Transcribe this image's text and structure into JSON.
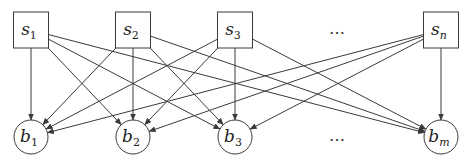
{
  "diagram": {
    "type": "bipartite-directed-graph",
    "sources": [
      {
        "id": "s1",
        "base": "s",
        "sub": "1",
        "x": 31
      },
      {
        "id": "s2",
        "base": "s",
        "sub": "2",
        "x": 133
      },
      {
        "id": "s3",
        "base": "s",
        "sub": "3",
        "x": 235
      },
      {
        "id": "sn",
        "base": "s",
        "sub": "n",
        "x": 441
      }
    ],
    "targets": [
      {
        "id": "b1",
        "base": "b",
        "sub": "1",
        "x": 31
      },
      {
        "id": "b2",
        "base": "b",
        "sub": "2",
        "x": 133
      },
      {
        "id": "b3",
        "base": "b",
        "sub": "3",
        "x": 235
      },
      {
        "id": "bm",
        "base": "b",
        "sub": "m",
        "x": 441
      }
    ],
    "ellipsis_top": "…",
    "ellipsis_bottom": "…",
    "edges": [
      [
        "s1",
        "b1"
      ],
      [
        "s1",
        "b2"
      ],
      [
        "s1",
        "b3"
      ],
      [
        "s1",
        "bm"
      ],
      [
        "s2",
        "b1"
      ],
      [
        "s2",
        "b2"
      ],
      [
        "s2",
        "b3"
      ],
      [
        "s2",
        "bm"
      ],
      [
        "s3",
        "b1"
      ],
      [
        "s3",
        "b2"
      ],
      [
        "s3",
        "b3"
      ],
      [
        "s3",
        "bm"
      ],
      [
        "sn",
        "b1"
      ],
      [
        "sn",
        "b2"
      ],
      [
        "sn",
        "b3"
      ],
      [
        "sn",
        "bm"
      ]
    ],
    "colors": {
      "stroke": "#3a3a3a",
      "background": "#ffffff"
    }
  }
}
